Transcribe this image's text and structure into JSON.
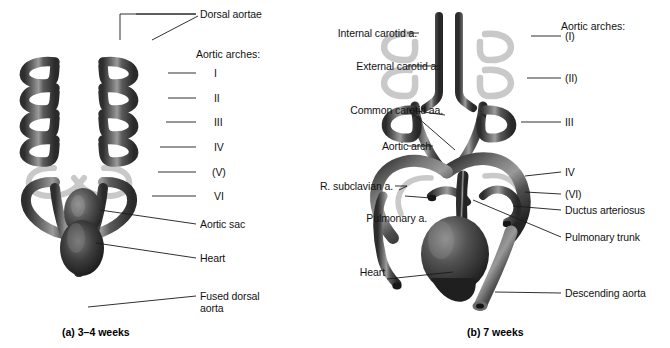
{
  "figure": {
    "domain": "anatomical-diagram"
  },
  "panel_a": {
    "caption": "(a) 3–4 weeks",
    "arches_heading": "Aortic arches:",
    "labels": [
      {
        "id": "dorsal-aortae",
        "text": "Dorsal aortae"
      },
      {
        "id": "arch-1",
        "text": "I"
      },
      {
        "id": "arch-2",
        "text": "II"
      },
      {
        "id": "arch-3",
        "text": "III"
      },
      {
        "id": "arch-4",
        "text": "IV"
      },
      {
        "id": "arch-5",
        "text": "(V)"
      },
      {
        "id": "arch-6",
        "text": "VI"
      },
      {
        "id": "aortic-sac",
        "text": "Aortic sac"
      },
      {
        "id": "heart",
        "text": "Heart"
      },
      {
        "id": "fused-dorsal-aorta",
        "text": "Fused dorsal\naorta"
      }
    ]
  },
  "panel_b": {
    "caption": "(b) 7 weeks",
    "arches_heading": "Aortic arches:",
    "labels_left": [
      {
        "id": "internal-carotid",
        "text": "Internal carotid a."
      },
      {
        "id": "external-carotid",
        "text": "External carotid a."
      },
      {
        "id": "common-carotid",
        "text": "Common carotid aa."
      },
      {
        "id": "aortic-arch",
        "text": "Aortic arch"
      },
      {
        "id": "r-subclavian",
        "text": "R. subclavian a."
      },
      {
        "id": "pulmonary-a",
        "text": "Pulmonary a."
      },
      {
        "id": "heart",
        "text": "Heart"
      }
    ],
    "labels_right": [
      {
        "id": "arch-1",
        "text": "(I)"
      },
      {
        "id": "arch-2",
        "text": "(II)"
      },
      {
        "id": "arch-3",
        "text": "III"
      },
      {
        "id": "arch-4",
        "text": "IV"
      },
      {
        "id": "arch-6",
        "text": "(VI)"
      },
      {
        "id": "ductus-arteriosus",
        "text": "Ductus arteriosus"
      },
      {
        "id": "pulmonary-trunk",
        "text": "Pulmonary trunk"
      },
      {
        "id": "descending-aorta",
        "text": "Descending aorta"
      }
    ]
  },
  "colors": {
    "vessel_dark": "#3f3f3f",
    "vessel_mid": "#6a6a6a",
    "vessel_light": "#b9b9b9",
    "vessel_regressed": "#c6c6c6",
    "leader_line": "#1a1a1a",
    "background": "#ffffff",
    "text": "#121212"
  }
}
